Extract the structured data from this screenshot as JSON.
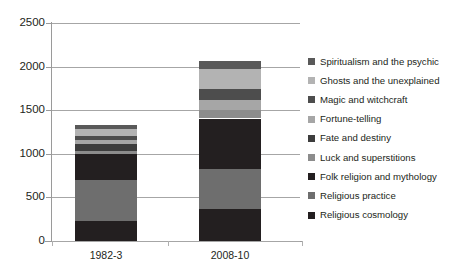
{
  "chart_data": {
    "type": "bar",
    "subtype": "stacked-vertical",
    "title": "",
    "xlabel": "",
    "ylabel": "",
    "categories": [
      "1982-3",
      "2008-10"
    ],
    "ylim": [
      0,
      2500
    ],
    "yticks": [
      0,
      500,
      1000,
      1500,
      2000,
      2500
    ],
    "ytick_labels": [
      "0",
      "500",
      "1000",
      "1500",
      "2000",
      "2500"
    ],
    "grid": true,
    "legend_position": "right",
    "stack_order_bottom_to_top": [
      "Religious cosmology",
      "Religious practice",
      "Folk religion and mythology",
      "Luck and superstitions",
      "Fate and destiny",
      "Fortune-telling",
      "Magic and witchcraft",
      "Ghosts and the unexplained",
      "Spiritualism and the psychic"
    ],
    "series": [
      {
        "name": "Religious cosmology",
        "color": "#231f20",
        "values": [
          230,
          370
        ]
      },
      {
        "name": "Religious practice",
        "color": "#6e6e6e",
        "values": [
          470,
          460
        ]
      },
      {
        "name": "Folk religion and mythology",
        "color": "#231f20",
        "values": [
          300,
          575
        ]
      },
      {
        "name": "Luck and superstitions",
        "color": "#8c8c8c",
        "values": [
          35,
          100
        ]
      },
      {
        "name": "Fate and destiny",
        "color": "#3d3d3d",
        "values": [
          80,
          0
        ]
      },
      {
        "name": "Fortune-telling",
        "color": "#a6a6a6",
        "values": [
          40,
          110
        ]
      },
      {
        "name": "Magic and witchcraft",
        "color": "#4d4d4d",
        "values": [
          55,
          125
        ]
      },
      {
        "name": "Ghosts and the unexplained",
        "color": "#b3b3b3",
        "values": [
          70,
          230
        ]
      },
      {
        "name": "Spiritualism and the psychic",
        "color": "#595959",
        "values": [
          50,
          90
        ]
      }
    ],
    "totals": [
      1330,
      2060
    ]
  },
  "legend": {
    "items": [
      {
        "label": "Spiritualism and the psychic",
        "color": "#595959"
      },
      {
        "label": "Ghosts and the unexplained",
        "color": "#b3b3b3"
      },
      {
        "label": "Magic and witchcraft",
        "color": "#4d4d4d"
      },
      {
        "label": "Fortune-telling",
        "color": "#a6a6a6"
      },
      {
        "label": "Fate and destiny",
        "color": "#3d3d3d"
      },
      {
        "label": "Luck and superstitions",
        "color": "#8c8c8c"
      },
      {
        "label": "Folk religion and mythology",
        "color": "#231f20"
      },
      {
        "label": "Religious practice",
        "color": "#6e6e6e"
      },
      {
        "label": "Religious cosmology",
        "color": "#231f20"
      }
    ]
  },
  "axis_colors": {
    "gridline": "#a6a6a6",
    "axis": "#9a9a9a",
    "text": "#231f20"
  }
}
